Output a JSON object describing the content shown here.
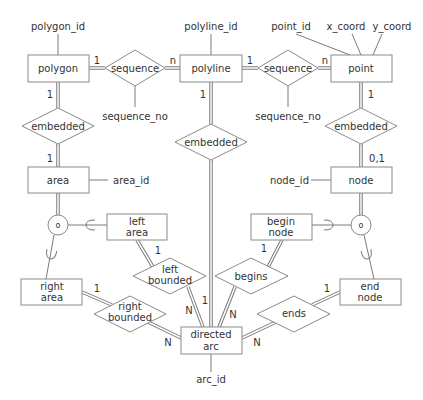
{
  "diagram": {
    "type": "entity-relationship",
    "entities": {
      "polygon": "polygon",
      "polyline": "polyline",
      "point": "point",
      "area": "area",
      "node": "node",
      "left_area_1": "left",
      "left_area_2": "area",
      "begin_node_1": "begin",
      "begin_node_2": "node",
      "right_area_1": "right",
      "right_area_2": "area",
      "end_node_1": "end",
      "end_node_2": "node",
      "directed_arc_1": "directed",
      "directed_arc_2": "arc"
    },
    "relationships": {
      "sequence_left": "sequence",
      "sequence_right": "sequence",
      "embedded_left": "embedded",
      "embedded_middle": "embedded",
      "embedded_right": "embedded",
      "left_bounded_1": "left",
      "left_bounded_2": "bounded",
      "right_bounded_1": "right",
      "right_bounded_2": "bounded",
      "begins": "begins",
      "ends": "ends"
    },
    "attributes": {
      "polygon_id": "polygon_id",
      "polyline_id": "polyline_id",
      "point_id": "point_id",
      "x_coord": "x_coord",
      "y_coord": "y_coord",
      "sequence_no_left": "sequence_no",
      "sequence_no_right": "sequence_no",
      "area_id": "area_id",
      "node_id": "node_id",
      "arc_id": "arc_id"
    },
    "cardinalities": {
      "polygon_sequence": "1",
      "sequence_polyline": "n",
      "polyline_sequence": "1",
      "sequence_point": "n",
      "polygon_embedded": "1",
      "embedded_area": "1",
      "polyline_embedded": "1",
      "point_embedded": "1",
      "embedded_node": "0,1",
      "left_area_bounded": "1",
      "left_bounded_arc": "N",
      "arc_embedded": "1",
      "begin_node_begins": "1",
      "begins_arc": "N",
      "right_area_bounded": "1",
      "right_bounded_arc": "N",
      "end_node_ends": "1",
      "ends_arc": "N"
    },
    "specialization_symbols": {
      "area_circle": "o",
      "node_circle": "o"
    }
  }
}
